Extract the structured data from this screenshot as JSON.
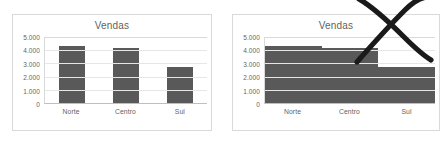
{
  "page": {
    "background_color": "#ffffff",
    "bar_color": "#595959",
    "gridline_color": "#e6e6e6",
    "border_color": "#d9d9d9",
    "text_color": "#636363"
  },
  "panels": [
    {
      "id": "good",
      "name": "correct-example",
      "marked_incorrect": false,
      "bar_gap": "normal"
    },
    {
      "id": "bad",
      "name": "incorrect-example",
      "marked_incorrect": true,
      "bar_gap": "none",
      "annotation": "rejection-x-mark"
    }
  ],
  "chart_data": [
    {
      "type": "bar",
      "title": "Vendas",
      "xlabel": "",
      "ylabel": "",
      "categories": [
        "Norte",
        "Centro",
        "Sul"
      ],
      "values": [
        4300,
        4150,
        2700
      ],
      "yticks": [
        0,
        1000,
        2000,
        3000,
        4000,
        5000
      ],
      "ytick_labels": [
        "0",
        "1.000",
        "2.000",
        "3.000",
        "4.000",
        "5.000"
      ],
      "ylim": [
        0,
        5000
      ],
      "grid": true,
      "legend": false,
      "series_color": "#595959",
      "gap_width": "normal"
    },
    {
      "type": "bar",
      "title": "Vendas",
      "xlabel": "",
      "ylabel": "",
      "categories": [
        "Norte",
        "Centro",
        "Sul"
      ],
      "values": [
        4300,
        4150,
        2700
      ],
      "yticks": [
        0,
        1000,
        2000,
        3000,
        4000,
        5000
      ],
      "ytick_labels": [
        "0",
        "1.000",
        "2.000",
        "3.000",
        "4.000",
        "5.000"
      ],
      "ylim": [
        0,
        5000
      ],
      "grid": true,
      "legend": false,
      "series_color": "#595959",
      "gap_width": "zero"
    }
  ]
}
